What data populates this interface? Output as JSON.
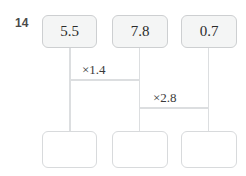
{
  "worksheet": {
    "question_number": "14",
    "background_color": "#ffffff",
    "box_fill_color": "#f4f5f5",
    "box_border_color": "#d2d4d6",
    "line_color": "#dcdee0",
    "text_color": "#2b2b2b"
  },
  "diagram": {
    "type": "multiplication-ladder",
    "top_row": {
      "name": "given-values",
      "boxes": [
        {
          "id": "top-1",
          "value": "5.5",
          "filled": true
        },
        {
          "id": "top-2",
          "value": "7.8",
          "filled": true
        },
        {
          "id": "top-3",
          "value": "0.7",
          "filled": true
        }
      ]
    },
    "bottom_row": {
      "name": "answer-boxes",
      "boxes": [
        {
          "id": "bottom-1",
          "value": "",
          "filled": false
        },
        {
          "id": "bottom-2",
          "value": "",
          "filled": false
        },
        {
          "id": "bottom-3",
          "value": "",
          "filled": false
        }
      ]
    },
    "operations": [
      {
        "id": "op-1",
        "label": "×1.4",
        "operator": "×",
        "factor": "1.4",
        "from_column": 1,
        "to_column": 2
      },
      {
        "id": "op-2",
        "label": "×2.8",
        "operator": "×",
        "factor": "2.8",
        "from_column": 2,
        "to_column": 3
      }
    ]
  }
}
